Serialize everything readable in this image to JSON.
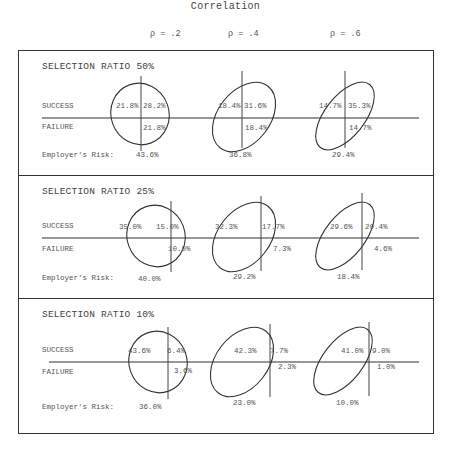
{
  "header": {
    "title": "Correlation",
    "rho_labels": [
      "ρ = .2",
      "ρ = .4",
      "ρ = .6"
    ]
  },
  "labels": {
    "success": "SUCCESS",
    "failure": "FAILURE",
    "risk": "Employer's Risk:"
  },
  "panels": [
    {
      "title": "SELECTION RATIO 50%",
      "cells": [
        {
          "success_left": "21.8%",
          "success_right": "28.2%",
          "failure_right": "21.8%",
          "risk": "43.6%"
        },
        {
          "success_left": "18.4%",
          "success_right": "31.6%",
          "failure_right": "18.4%",
          "risk": "36.8%"
        },
        {
          "success_left": "14.7%",
          "success_right": "35.3%",
          "failure_right": "14.7%",
          "risk": "29.4%"
        }
      ]
    },
    {
      "title": "SELECTION RATIO 25%",
      "cells": [
        {
          "success_left": "35.0%",
          "success_right": "15.0%",
          "failure_right": "10.0%",
          "risk": "40.0%"
        },
        {
          "success_left": "32.3%",
          "success_right": "17.7%",
          "failure_right": "7.3%",
          "risk": "29.2%"
        },
        {
          "success_left": "29.6%",
          "success_right": "20.4%",
          "failure_right": "4.6%",
          "risk": "18.4%"
        }
      ]
    },
    {
      "title": "SELECTION RATIO 10%",
      "cells": [
        {
          "success_left": "43.6%",
          "success_right": "6.4%",
          "failure_right": "3.6%",
          "risk": "36.0%"
        },
        {
          "success_left": "42.3%",
          "success_right": "7.7%",
          "failure_right": "2.3%",
          "risk": "23.0%"
        },
        {
          "success_left": "41.0%",
          "success_right": "9.0%",
          "failure_right": "1.0%",
          "risk": "10.0%"
        }
      ]
    }
  ]
}
